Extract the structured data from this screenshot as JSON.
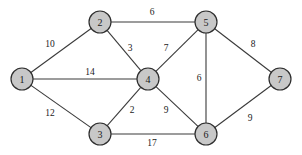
{
  "chart_data": {
    "type": "diagram",
    "title": "",
    "subtitle": "",
    "xlabel": "",
    "ylabel": "",
    "graph_kind": "undirected-weighted-graph",
    "node_fill": "#c8c8c8",
    "node_stroke": "#2e2e2e",
    "edge_color": "#3a3a3a",
    "background": "#ffffff",
    "nodes": [
      {
        "id": "1",
        "label": "1",
        "x": 22,
        "y": 79,
        "r": 11
      },
      {
        "id": "2",
        "label": "2",
        "x": 100,
        "y": 22,
        "r": 11
      },
      {
        "id": "3",
        "label": "3",
        "x": 100,
        "y": 134,
        "r": 11
      },
      {
        "id": "4",
        "label": "4",
        "x": 148,
        "y": 79,
        "r": 11
      },
      {
        "id": "5",
        "label": "5",
        "x": 206,
        "y": 22,
        "r": 11
      },
      {
        "id": "6",
        "label": "6",
        "x": 206,
        "y": 134,
        "r": 11
      },
      {
        "id": "7",
        "label": "7",
        "x": 280,
        "y": 79,
        "r": 11
      }
    ],
    "edges": [
      {
        "source": "1",
        "target": "2",
        "weight": 10,
        "label": "10",
        "lx": 50,
        "ly": 44
      },
      {
        "source": "1",
        "target": "4",
        "weight": 14,
        "label": "14",
        "lx": 90,
        "ly": 72
      },
      {
        "source": "1",
        "target": "3",
        "weight": 12,
        "label": "12",
        "lx": 50,
        "ly": 113
      },
      {
        "source": "2",
        "target": "5",
        "weight": 6,
        "label": "6",
        "lx": 152,
        "ly": 12
      },
      {
        "source": "2",
        "target": "4",
        "weight": 3,
        "label": "3",
        "lx": 130,
        "ly": 48
      },
      {
        "source": "4",
        "target": "5",
        "weight": 7,
        "label": "7",
        "lx": 166,
        "ly": 48
      },
      {
        "source": "5",
        "target": "7",
        "weight": 8,
        "label": "8",
        "lx": 253,
        "ly": 44
      },
      {
        "source": "5",
        "target": "6",
        "weight": 6,
        "label": "6",
        "lx": 199,
        "ly": 78
      },
      {
        "source": "3",
        "target": "4",
        "weight": 2,
        "label": "2",
        "lx": 132,
        "ly": 110
      },
      {
        "source": "4",
        "target": "6",
        "weight": 9,
        "label": "9",
        "lx": 166,
        "ly": 110
      },
      {
        "source": "3",
        "target": "6",
        "weight": 17,
        "label": "17",
        "lx": 152,
        "ly": 143
      },
      {
        "source": "6",
        "target": "7",
        "weight": 9,
        "label": "9",
        "lx": 250,
        "ly": 118
      }
    ],
    "node_count": 7,
    "edge_count": 12,
    "legend": [],
    "annotations": []
  }
}
